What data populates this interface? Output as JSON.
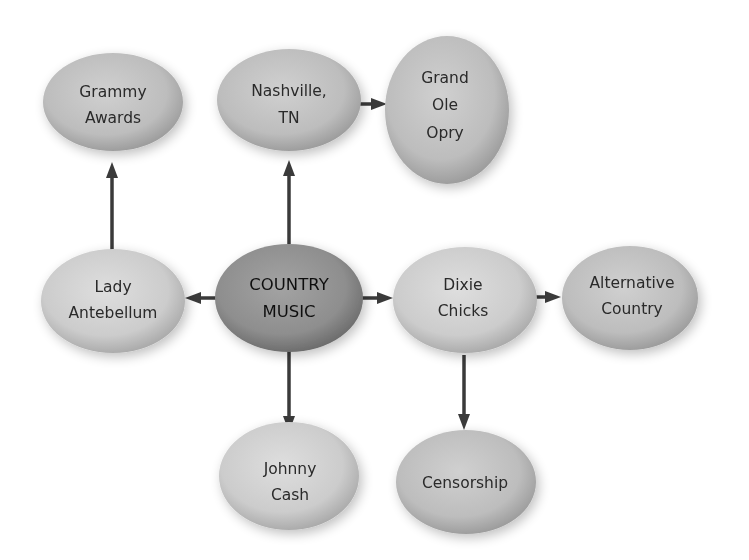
{
  "diagram": {
    "colors": {
      "background": "#ffffff",
      "node_fill_light": "#d4d4d4",
      "node_fill_edge": "#9a9a9a",
      "center_fill": "#8f8f8f",
      "center_edge": "#5e5e5e",
      "arrow": "#3a3a3a",
      "text": "#2a2a2a"
    },
    "nodes": {
      "grammy": {
        "lines": [
          "Grammy",
          "Awards"
        ]
      },
      "nashville": {
        "lines": [
          "Nashville,",
          "TN"
        ]
      },
      "opry": {
        "lines": [
          "Grand",
          "Ole",
          "Opry"
        ]
      },
      "lady": {
        "lines": [
          "Lady",
          "Antebellum"
        ]
      },
      "country": {
        "lines": [
          "COUNTRY",
          "MUSIC"
        ]
      },
      "dixie": {
        "lines": [
          "Dixie",
          "Chicks"
        ]
      },
      "alternative": {
        "lines": [
          "Alternative",
          "Country"
        ]
      },
      "johnny": {
        "lines": [
          "Johnny",
          "Cash"
        ]
      },
      "censorship": {
        "lines": [
          "Censorship"
        ]
      }
    },
    "edges": [
      {
        "from": "COUNTRY MUSIC",
        "to": "Nashville, TN"
      },
      {
        "from": "Nashville, TN",
        "to": "Grand Ole Opry"
      },
      {
        "from": "COUNTRY MUSIC",
        "to": "Lady Antebellum"
      },
      {
        "from": "Lady Antebellum",
        "to": "Grammy Awards"
      },
      {
        "from": "COUNTRY MUSIC",
        "to": "Dixie Chicks"
      },
      {
        "from": "Dixie Chicks",
        "to": "Alternative Country"
      },
      {
        "from": "COUNTRY MUSIC",
        "to": "Johnny Cash"
      },
      {
        "from": "Dixie Chicks",
        "to": "Censorship"
      }
    ]
  }
}
